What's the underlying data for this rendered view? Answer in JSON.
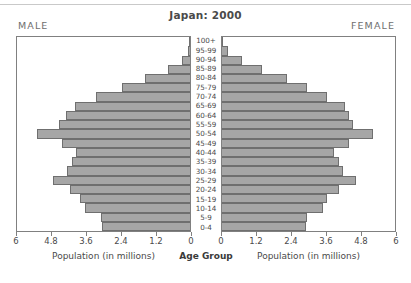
{
  "chart_data": {
    "type": "bar",
    "subtype": "population-pyramid",
    "title": "Japan: 2000",
    "xlabel": "Population (in millions)",
    "ylabel": "Age Group",
    "center_axis_label": "Age Group",
    "left_panel_label": "MALE",
    "right_panel_label": "FEMALE",
    "grid": false,
    "legend": "none",
    "units": "millions",
    "xlim": [
      0,
      6
    ],
    "tick_values": [
      0,
      1.2,
      2.4,
      3.6,
      4.8,
      6
    ],
    "left_tick_labels": [
      "6",
      "4.8",
      "3.6",
      "2.4",
      "1.2",
      "0"
    ],
    "right_tick_labels": [
      "0",
      "1.2",
      "2.4",
      "3.6",
      "4.8",
      "6"
    ],
    "categories": [
      "0-4",
      "5-9",
      "10-14",
      "15-19",
      "20-24",
      "25-29",
      "30-34",
      "35-39",
      "40-44",
      "45-49",
      "50-54",
      "55-59",
      "60-64",
      "65-69",
      "70-74",
      "75-79",
      "80-84",
      "85-89",
      "90-94",
      "95-99",
      "100+"
    ],
    "series": [
      {
        "name": "MALE",
        "side": "left",
        "values": [
          3.05,
          3.1,
          3.65,
          3.8,
          4.15,
          4.75,
          4.25,
          4.1,
          3.95,
          4.45,
          5.3,
          4.55,
          4.3,
          4.0,
          3.25,
          2.35,
          1.55,
          0.78,
          0.29,
          0.07,
          0.01
        ]
      },
      {
        "name": "FEMALE",
        "side": "right",
        "values": [
          2.9,
          2.95,
          3.5,
          3.65,
          4.05,
          4.65,
          4.2,
          4.05,
          3.9,
          4.4,
          5.25,
          4.55,
          4.4,
          4.25,
          3.65,
          2.95,
          2.25,
          1.4,
          0.68,
          0.2,
          0.03
        ]
      }
    ],
    "colors": {
      "bar_fill": "#a6a6a6",
      "bar_stroke": "#6f6f6f",
      "panel_border": "#808080",
      "text": "#4a4a4a",
      "background": "#ffffff"
    }
  }
}
